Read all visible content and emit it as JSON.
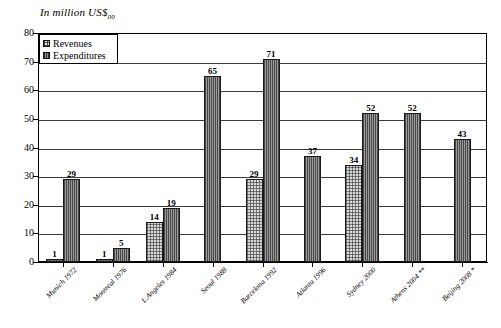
{
  "chart_data": {
    "type": "bar",
    "title": "In million US$",
    "title_subscript": "00",
    "xlabel": "",
    "ylabel": "",
    "ylim": [
      0,
      80
    ],
    "ytick_step": 10,
    "yticks": [
      0,
      10,
      20,
      30,
      40,
      50,
      60,
      70,
      80
    ],
    "grid": true,
    "legend_position": "top-left",
    "categories": [
      "Munich 1972",
      "Montreal 1976",
      "L.Angeles 1984",
      "Seoul  1988",
      "Barcelona 1992",
      "Atlanta 1996",
      "Sydney 2000",
      "Athens 2004 **",
      "Beijing 2008 *"
    ],
    "series": [
      {
        "name": "Revenues",
        "values": [
          1,
          1,
          14,
          null,
          29,
          null,
          34,
          null,
          null
        ]
      },
      {
        "name": "Expenditures",
        "values": [
          29,
          5,
          19,
          65,
          71,
          37,
          52,
          52,
          43
        ]
      }
    ]
  },
  "legend": {
    "items": [
      {
        "label": "Revenues",
        "key": "revenues"
      },
      {
        "label": "Expenditures",
        "key": "expenditures"
      }
    ]
  },
  "colors": {
    "revenues_fill": "#d8d8d8",
    "expenditures_fill": "#9a9a9a",
    "axis": "#000000",
    "grid": "#3a3a3a",
    "background": "#ffffff"
  }
}
